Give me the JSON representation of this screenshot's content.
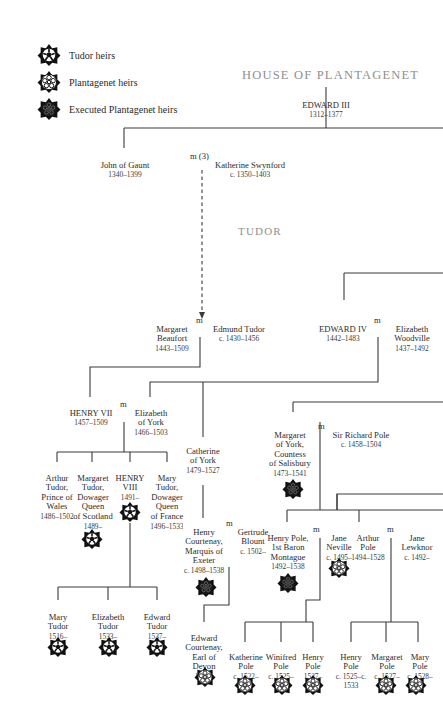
{
  "legend": [
    {
      "label": "Tudor heirs",
      "icon": "tudor-rose-icon"
    },
    {
      "label": "Plantagenet heirs",
      "icon": "plantagenet-rose-icon"
    },
    {
      "label": "Executed Plantagenet heirs",
      "icon": "executed-rose-icon"
    }
  ],
  "houses": {
    "plantagenet": "HOUSE OF PLANTAGENET",
    "tudor": "TUDOR"
  },
  "people": {
    "edward3": {
      "name": "EDWARD III",
      "dates": "1312–1377"
    },
    "john_of_gaunt": {
      "name": "John of Gaunt",
      "dates": "1340–1399"
    },
    "katherine_swynford": {
      "name": "Katherine Swynford",
      "dates": "c. 1350–1403"
    },
    "margaret_beaufort": {
      "name": "Margaret\nBeaufort",
      "dates": "1443–1509"
    },
    "edmund_tudor": {
      "name": "Edmund Tudor",
      "dates": "c. 1430–1456"
    },
    "edward4": {
      "name": "EDWARD IV",
      "dates": "1442–1483"
    },
    "elizabeth_woodville": {
      "name": "Elizabeth\nWoodville",
      "dates": "1437–1492"
    },
    "henry7": {
      "name": "HENRY VII",
      "dates": "1457–1509"
    },
    "elizabeth_of_york": {
      "name": "Elizabeth\nof York",
      "dates": "1466–1503"
    },
    "catherine_of_york": {
      "name": "Catherine\nof York",
      "dates": "1479–1527"
    },
    "margaret_of_york": {
      "name": "Margaret\nof York,\nCountess\nof Salisbury",
      "dates": "1473–1541"
    },
    "richard_pole": {
      "name": "Sir Richard Pole",
      "dates": "c. 1458–1504"
    },
    "arthur_tudor": {
      "name": "Arthur\nTudor,\nPrince of\nWales",
      "dates": "1486–1502"
    },
    "margaret_tudor": {
      "name": "Margaret\nTudor,\nDowager\nQueen\nof Scotland",
      "dates": "1489–"
    },
    "henry8": {
      "name": "HENRY\nVIII",
      "dates": "1491–"
    },
    "mary_tudor_france": {
      "name": "Mary\nTudor,\nDowager\nQueen\nof France",
      "dates": "1496–1533"
    },
    "henry_courtenay": {
      "name": "Henry\nCourtenay,\nMarquis of\nExeter",
      "dates": "c. 1498–1538"
    },
    "gertrude_blount": {
      "name": "Gertrude\nBlount",
      "dates": "c. 1502–"
    },
    "henry_pole": {
      "name": "Henry Pole,\n1st Baron\nMontague",
      "dates": "1492–1538"
    },
    "jane_neville": {
      "name": "Jane\nNeville",
      "dates": "c. 1495–"
    },
    "arthur_pole": {
      "name": "Arthur\nPole",
      "dates": "1494–1528"
    },
    "jane_lewknor": {
      "name": "Jane\nLewknor",
      "dates": "c. 1492–"
    },
    "mary_tudor": {
      "name": "Mary\nTudor",
      "dates": "1516–"
    },
    "elizabeth_tudor": {
      "name": "Elizabeth\nTudor",
      "dates": "1533–"
    },
    "edward_tudor": {
      "name": "Edward\nTudor",
      "dates": "1537–"
    },
    "edward_courtenay": {
      "name": "Edward\nCourtenay,\nEarl of\nDevon",
      "dates": "1526–"
    },
    "katherine_pole": {
      "name": "Katherine\nPole",
      "dates": "c. 1522–"
    },
    "winifred_pole": {
      "name": "Winifred\nPole",
      "dates": "c. 1525–"
    },
    "henry_pole_younger": {
      "name": "Henry\nPole",
      "dates": "1527–"
    },
    "henry_pole_arthur": {
      "name": "Henry\nPole",
      "dates": "c. 1525–c. 1533"
    },
    "margaret_pole": {
      "name": "Margaret\nPole",
      "dates": "c. 1527–"
    },
    "mary_pole": {
      "name": "Mary\nPole",
      "dates": "c. 1528–"
    }
  },
  "marriage": {
    "m": "m",
    "m3": "m (3)"
  },
  "colors": {
    "line": "#3a3a3a",
    "house_label": "#8f8f8f",
    "icon": "#111111"
  }
}
